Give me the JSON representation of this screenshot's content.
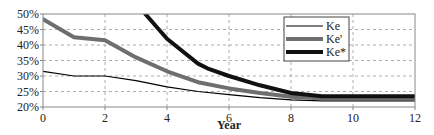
{
  "chart_data": {
    "type": "line",
    "title": "",
    "xlabel": "Year",
    "ylabel": "",
    "xlim": [
      0,
      12
    ],
    "ylim": [
      20,
      50
    ],
    "x_ticks": [
      "0",
      "2",
      "4",
      "6",
      "8",
      "10",
      "12"
    ],
    "y_ticks": [
      "20%",
      "25%",
      "30%",
      "35%",
      "40%",
      "45%",
      "50%"
    ],
    "grid": true,
    "legend": "top-right",
    "series": [
      {
        "name": "Ke",
        "color": "#000000",
        "style": "thin",
        "x": [
          0,
          1,
          2,
          3,
          4,
          5,
          6,
          7,
          8,
          9,
          10,
          11,
          12
        ],
        "y": [
          31.5,
          30,
          30,
          28.5,
          26.5,
          25,
          24,
          23,
          22.3,
          22,
          22,
          22,
          22
        ]
      },
      {
        "name": "Ke'",
        "color": "#6e6e6e",
        "style": "thick",
        "x": [
          0,
          1,
          2,
          3,
          4,
          5,
          6,
          7,
          8,
          9,
          10,
          11,
          12
        ],
        "y": [
          48.3,
          42.5,
          41.5,
          36,
          31.5,
          28,
          26,
          24.5,
          23.3,
          22.7,
          22.7,
          22.7,
          22.7
        ]
      },
      {
        "name": "Ke*",
        "color": "#111111",
        "style": "thick",
        "x": [
          3.3,
          4,
          5,
          5.3,
          6,
          7,
          8,
          9,
          10,
          11,
          12
        ],
        "y": [
          50,
          42,
          34,
          32.5,
          30,
          27,
          24.5,
          23.5,
          23.5,
          23.5,
          23.5
        ]
      }
    ]
  }
}
